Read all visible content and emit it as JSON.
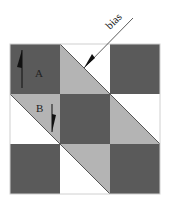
{
  "diagram": {
    "labels": {
      "piece_a": "A",
      "piece_b": "B",
      "bias": "bias"
    },
    "colors": {
      "dark": "#5a5a5a",
      "light": "#b4b4b4",
      "white": "#ffffff",
      "line": "#333333",
      "frame": "#d8d8d8"
    },
    "grid": {
      "rows": 3,
      "cols": 3,
      "cells": [
        [
          "dark",
          "half-square triangle (gray lower-left, white upper-right)",
          "dark"
        ],
        [
          "half-square triangle (gray upper-right, white lower-left)",
          "dark",
          "half-square triangle (gray lower-left, white upper-right)"
        ],
        [
          "dark",
          "half-square triangle (gray upper-right, white lower-left)",
          "dark"
        ]
      ]
    },
    "arrows": [
      {
        "label": "A",
        "direction": "up"
      },
      {
        "label": "B",
        "direction": "down"
      },
      {
        "label": "bias",
        "direction": "down-left"
      }
    ]
  }
}
